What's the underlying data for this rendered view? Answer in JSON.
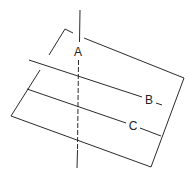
{
  "diagram": {
    "labels": {
      "a": "A",
      "b": "B",
      "c": "C"
    },
    "line_color": "#2a2a2a"
  }
}
